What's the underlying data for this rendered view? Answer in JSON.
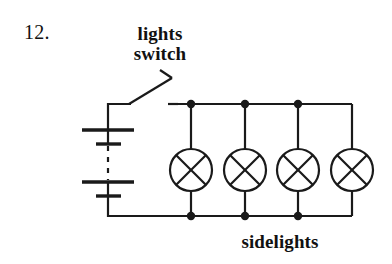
{
  "page": {
    "question_number": "12.",
    "background_color": "#ffffff",
    "ink_color": "#1a1a1a"
  },
  "labels": {
    "switch_label_line1": "lights",
    "switch_label_line2": "switch",
    "lamps_label": "sidelights"
  },
  "circuit": {
    "type": "parallel-lamp-circuit",
    "components": [
      {
        "name": "battery",
        "icon": "battery-icon",
        "cells": 2,
        "has_dashed_continuation": true,
        "position": {
          "x": 108,
          "y": 165
        }
      },
      {
        "name": "lights-switch",
        "icon": "open-switch-icon",
        "state": "open",
        "position": {
          "x": 150,
          "y": 95
        }
      },
      {
        "name": "lamp-1",
        "icon": "lamp-icon",
        "position": {
          "x": 191,
          "y": 170
        }
      },
      {
        "name": "lamp-2",
        "icon": "lamp-icon",
        "position": {
          "x": 245,
          "y": 170
        }
      },
      {
        "name": "lamp-3",
        "icon": "lamp-icon",
        "position": {
          "x": 298,
          "y": 170
        }
      },
      {
        "name": "lamp-4",
        "icon": "lamp-icon",
        "position": {
          "x": 352,
          "y": 170
        }
      }
    ],
    "junction_dots_top": [
      191,
      245,
      298
    ],
    "junction_dots_bottom": [
      191,
      245,
      298
    ],
    "rails": {
      "top_y": 104,
      "bottom_y": 216,
      "left_x": 108,
      "right_x": 352
    }
  }
}
